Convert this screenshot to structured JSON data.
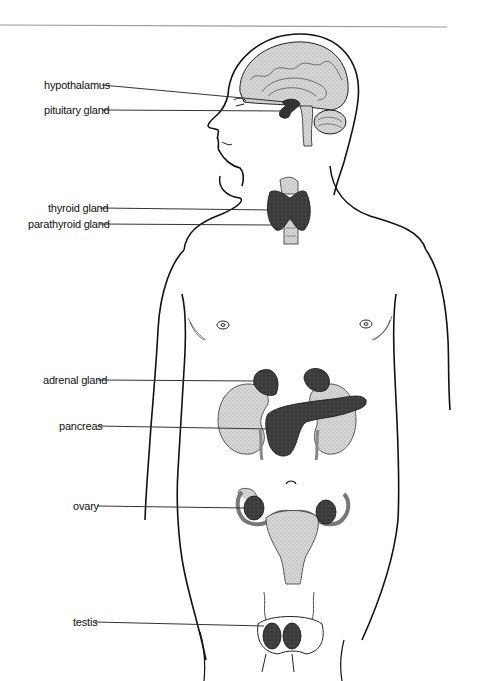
{
  "diagram": {
    "labels": [
      {
        "id": "hypothalamus",
        "text": "hypothalamus"
      },
      {
        "id": "pituitary",
        "text": "pituitary gland"
      },
      {
        "id": "thyroid",
        "text": "thyroid gland"
      },
      {
        "id": "parathyroid",
        "text": "parathyroid gland"
      },
      {
        "id": "adrenal",
        "text": "adrenal gland"
      },
      {
        "id": "pancreas",
        "text": "pancreas"
      },
      {
        "id": "ovary",
        "text": "ovary"
      },
      {
        "id": "testis",
        "text": "testis"
      }
    ],
    "colors": {
      "outline": "#111111",
      "gland": "#3a3a3a",
      "tissue": "#cfcfcf",
      "leader": "#333333",
      "rule": "#9a9a9a"
    }
  }
}
